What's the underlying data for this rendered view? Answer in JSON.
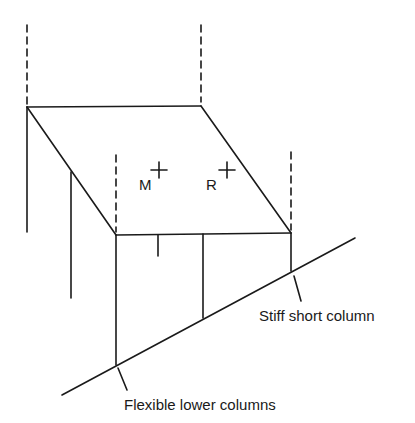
{
  "diagram": {
    "points": {
      "mass_center": {
        "label": "M"
      },
      "rigidity_center": {
        "label": "R"
      }
    },
    "annotations": {
      "stiff_column": "Stiff short column",
      "flexible_columns": "Flexible lower columns"
    },
    "colors": {
      "line": "#1a1a1a",
      "background": "#ffffff"
    }
  }
}
